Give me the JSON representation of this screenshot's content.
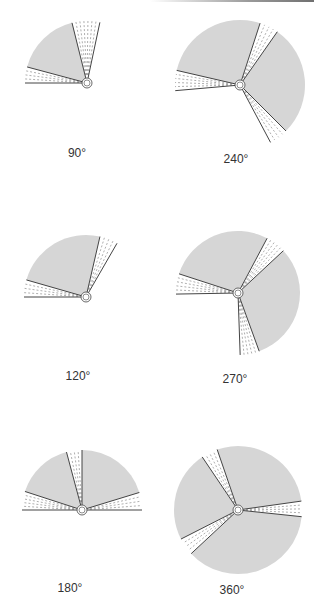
{
  "figure": {
    "panels": [
      {
        "label": "90°",
        "center": [
          87,
          83
        ],
        "radius": 62,
        "label_pos": [
          77,
          146
        ],
        "gray_sectors": [
          [
            104,
            165
          ]
        ],
        "dashed_sectors": [
          [
            78,
            104
          ],
          [
            165,
            180
          ]
        ]
      },
      {
        "label": "240°",
        "center": [
          240,
          85
        ],
        "radius": 65,
        "label_pos": [
          236,
          152
        ],
        "gray_sectors": [
          [
            72,
            167
          ],
          [
            -45,
            55
          ]
        ],
        "dashed_sectors": [
          [
            55,
            72
          ],
          [
            167,
            185
          ],
          [
            -62,
            -45
          ]
        ]
      },
      {
        "label": "120°",
        "center": [
          86,
          297
        ],
        "radius": 62,
        "label_pos": [
          78,
          369
        ],
        "gray_sectors": [
          [
            77,
            164
          ]
        ],
        "dashed_sectors": [
          [
            60,
            77
          ],
          [
            164,
            180
          ]
        ]
      },
      {
        "label": "270°",
        "center": [
          238,
          293
        ],
        "radius": 62,
        "label_pos": [
          235,
          372
        ],
        "gray_sectors": [
          [
            62,
            162
          ],
          [
            -70,
            43
          ]
        ],
        "dashed_sectors": [
          [
            43,
            62
          ],
          [
            162,
            181
          ],
          [
            -88,
            -70
          ]
        ]
      },
      {
        "label": "180°",
        "center": [
          82,
          510
        ],
        "radius": 60,
        "label_pos": [
          70,
          581
        ],
        "gray_sectors": [
          [
            105,
            162
          ],
          [
            17,
            90
          ]
        ],
        "dashed_sectors": [
          [
            90,
            105
          ],
          [
            162,
            180
          ],
          [
            0,
            17
          ]
        ]
      },
      {
        "label": "360°",
        "center": [
          238,
          510
        ],
        "radius": 64,
        "label_pos": [
          232,
          583
        ],
        "gray_sectors": [
          [
            124,
            207
          ],
          [
            8,
            109
          ],
          [
            223,
            354
          ]
        ],
        "dashed_sectors": [
          [
            109,
            124
          ],
          [
            -6,
            8
          ],
          [
            207,
            223
          ]
        ]
      }
    ],
    "colors": {
      "gray_fill": "#d6d6d6",
      "line": "#444444",
      "dash": "#9a9a9a",
      "text": "#333333"
    }
  }
}
